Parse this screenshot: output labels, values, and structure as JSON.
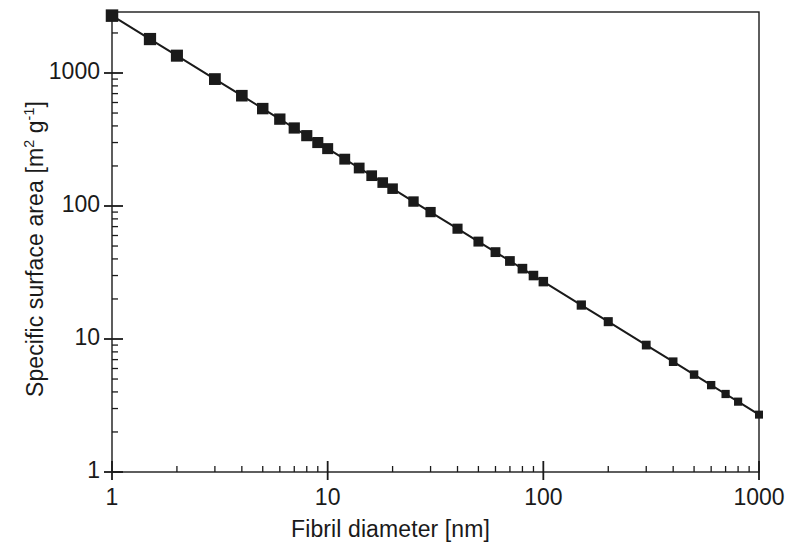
{
  "figure": {
    "background_color": "#ffffff",
    "ink_color": "#1a1a1a"
  },
  "chart_data": {
    "type": "line",
    "title": "",
    "subtitle": "",
    "xlabel": "Fibril diameter [nm]",
    "ylabel": "Specific surface area [m2 g-1]",
    "ylabel_parts": {
      "prefix": "Specific surface area [m",
      "sup1": "2",
      "middle": " g",
      "sup2": "-1",
      "suffix": "]"
    },
    "xscale": "log",
    "yscale": "log",
    "xlim": [
      1,
      1000
    ],
    "ylim": [
      1,
      3000
    ],
    "grid": false,
    "legend": null,
    "marker": "square",
    "marker_color": "#1a1a1a",
    "line_color": "#1a1a1a",
    "xticks": [
      1,
      10,
      100,
      1000
    ],
    "xtick_labels": [
      "1",
      "10",
      "100",
      "1000"
    ],
    "yticks": [
      1,
      10,
      100,
      1000
    ],
    "ytick_labels": [
      "1",
      "10",
      "100",
      "1000"
    ],
    "minor_ticks": true,
    "relation": "specific surface area = 2700 / fibril diameter",
    "x": [
      1,
      1.5,
      2,
      3,
      4,
      5,
      6,
      7,
      8,
      9,
      10,
      12,
      14,
      16,
      18,
      20,
      25,
      30,
      40,
      50,
      60,
      70,
      80,
      90,
      100,
      150,
      200,
      300,
      400,
      500,
      600,
      700,
      800,
      1000
    ],
    "y": [
      2700,
      1800,
      1350,
      900,
      675,
      540,
      450,
      386,
      338,
      300,
      270,
      225,
      193,
      169,
      150,
      135,
      108,
      90,
      67.5,
      54,
      45,
      38.6,
      33.8,
      30,
      27,
      18,
      13.5,
      9,
      6.75,
      5.4,
      4.5,
      3.86,
      3.38,
      2.7
    ],
    "series": [
      {
        "name": "specific surface area",
        "x": [
          1,
          1.5,
          2,
          3,
          4,
          5,
          6,
          7,
          8,
          9,
          10,
          12,
          14,
          16,
          18,
          20,
          25,
          30,
          40,
          50,
          60,
          70,
          80,
          90,
          100,
          150,
          200,
          300,
          400,
          500,
          600,
          700,
          800,
          1000
        ],
        "values": [
          2700,
          1800,
          1350,
          900,
          675,
          540,
          450,
          386,
          338,
          300,
          270,
          225,
          193,
          169,
          150,
          135,
          108,
          90,
          67.5,
          54,
          45,
          38.6,
          33.8,
          30,
          27,
          18,
          13.5,
          9,
          6.75,
          5.4,
          4.5,
          3.86,
          3.38,
          2.7
        ]
      }
    ]
  },
  "geometry": {
    "plot_left": 112,
    "plot_right": 759,
    "plot_top": 12,
    "plot_bottom": 472,
    "decade_px_x": 215.7,
    "decade_px_y": 133.0
  }
}
